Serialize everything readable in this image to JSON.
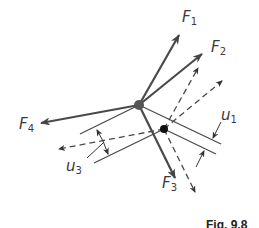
{
  "figure": {
    "caption": "Fig. 9.8",
    "colors": {
      "line": "#555555",
      "dark_line": "#3f3f3f",
      "text": "#3a3a3a",
      "background": "#ffffff"
    },
    "labels": {
      "F1": {
        "main": "F",
        "sub": "1"
      },
      "F2": {
        "main": "F",
        "sub": "2"
      },
      "F3": {
        "main": "F",
        "sub": "3"
      },
      "F4": {
        "main": "F",
        "sub": "4"
      },
      "u1": {
        "main": "u",
        "sub": "1"
      },
      "u3": {
        "main": "u",
        "sub": "3"
      }
    },
    "nodes": {
      "origin": {
        "x": 139,
        "y": 105,
        "r": 5,
        "color": "#555555"
      },
      "displaced": {
        "x": 164,
        "y": 129,
        "r": 4,
        "color": "#111111"
      }
    }
  }
}
